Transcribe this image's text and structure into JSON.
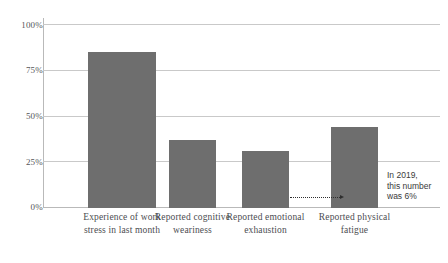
{
  "chart_data": {
    "type": "bar",
    "title": "",
    "subtitle": "",
    "xlabel": "",
    "ylabel": "",
    "ylim": [
      0,
      100
    ],
    "grid": true,
    "legend": false,
    "categories": [
      "Experience of work stress in last month",
      "Reported cognitive weariness",
      "Reported emotional exhaustion",
      "Reported physical fatigue"
    ],
    "category_lines": [
      [
        "Experience of",
        "work stress in",
        "last month"
      ],
      [
        "Reported",
        "cognitive",
        "weariness"
      ],
      [
        "Reported",
        "emotional",
        "exhaustion"
      ],
      [
        "Reported",
        "physical",
        "fatigue"
      ]
    ],
    "values": [
      85,
      37,
      31,
      44
    ],
    "value_suffix": "%",
    "ticks": [
      {
        "value": 100,
        "label": "100%"
      },
      {
        "value": 75,
        "label": "75%"
      },
      {
        "value": 50,
        "label": "50%"
      },
      {
        "value": 25,
        "label": "25%"
      },
      {
        "value": 0,
        "label": "0%"
      }
    ],
    "annotations": [
      {
        "target_category": "Reported physical fatigue",
        "value": 6,
        "lines": [
          "In 2019,",
          "this number",
          "was 6%"
        ],
        "marker": "dotted-line-with-arrow"
      }
    ],
    "colors": {
      "bar": "#6e6e6e",
      "grid": "#c9c9c9",
      "axis": "#b9b9b9",
      "tick_text": "#55565a",
      "label_text": "#4c4d51",
      "annotation_text": "#3a3a3a",
      "annotation_line": "#2e2e2e",
      "background": "#ffffff"
    }
  }
}
